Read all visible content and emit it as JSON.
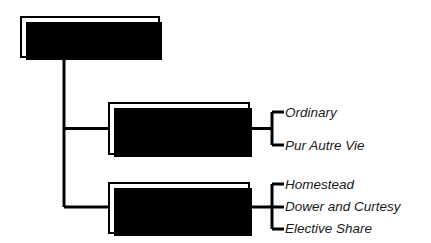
{
  "diagram": {
    "title_node": {
      "label": "Life Estates"
    },
    "branches": [
      {
        "label": "Conventional",
        "leaves": [
          {
            "label": "Ordinary"
          },
          {
            "label": "Pur Autre Vie"
          }
        ]
      },
      {
        "label": "Legal",
        "leaves": [
          {
            "label": "Homestead"
          },
          {
            "label": "Dower and Curtesy"
          },
          {
            "label": "Elective Share"
          }
        ]
      }
    ],
    "colors": {
      "background": "#ffffff",
      "line": "#000000",
      "box_border": "#000000",
      "box_fill": "#ffffff",
      "shadow": "#000000",
      "text": "#000000",
      "leaf_text": "#1a1a1a"
    }
  }
}
